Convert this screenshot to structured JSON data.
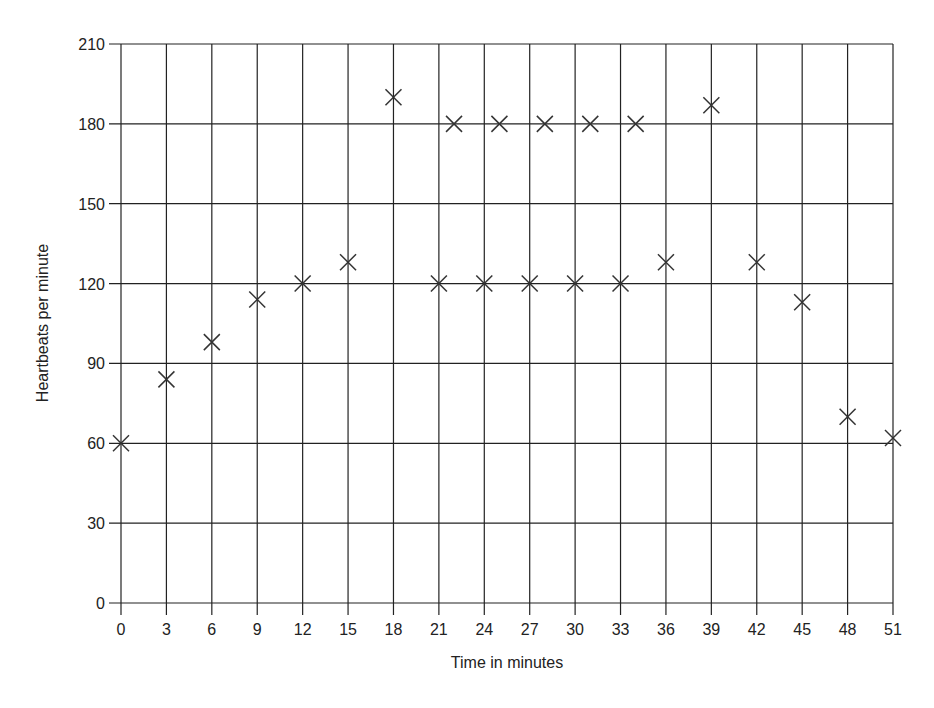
{
  "chart_data": {
    "type": "scatter",
    "title": "",
    "xlabel": "Time in minutes",
    "ylabel": "Heartbeats per minute",
    "xlim": [
      0,
      51
    ],
    "ylim": [
      0,
      210
    ],
    "grid": true,
    "legend": null,
    "x_ticks": [
      0,
      3,
      6,
      9,
      12,
      15,
      18,
      21,
      24,
      27,
      30,
      33,
      36,
      39,
      42,
      45,
      48,
      51
    ],
    "y_ticks": [
      0,
      30,
      60,
      90,
      120,
      150,
      180,
      210
    ],
    "marker": "x",
    "series": [
      {
        "name": "Heartbeats",
        "points": [
          {
            "x": 0,
            "y": 60
          },
          {
            "x": 3,
            "y": 84
          },
          {
            "x": 6,
            "y": 98
          },
          {
            "x": 9,
            "y": 114
          },
          {
            "x": 12,
            "y": 120
          },
          {
            "x": 15,
            "y": 128
          },
          {
            "x": 18,
            "y": 190
          },
          {
            "x": 21,
            "y": 120
          },
          {
            "x": 22,
            "y": 180
          },
          {
            "x": 24,
            "y": 120
          },
          {
            "x": 25,
            "y": 180
          },
          {
            "x": 27,
            "y": 120
          },
          {
            "x": 28,
            "y": 180
          },
          {
            "x": 30,
            "y": 120
          },
          {
            "x": 31,
            "y": 180
          },
          {
            "x": 33,
            "y": 120
          },
          {
            "x": 34,
            "y": 180
          },
          {
            "x": 36,
            "y": 128
          },
          {
            "x": 39,
            "y": 187
          },
          {
            "x": 42,
            "y": 128
          },
          {
            "x": 45,
            "y": 113
          },
          {
            "x": 48,
            "y": 70
          },
          {
            "x": 51,
            "y": 62
          }
        ]
      }
    ]
  },
  "layout": {
    "plot_left": 121,
    "plot_right": 893,
    "plot_top": 44,
    "plot_bottom": 603,
    "line_color": "#222222",
    "marker_color": "#333333"
  }
}
